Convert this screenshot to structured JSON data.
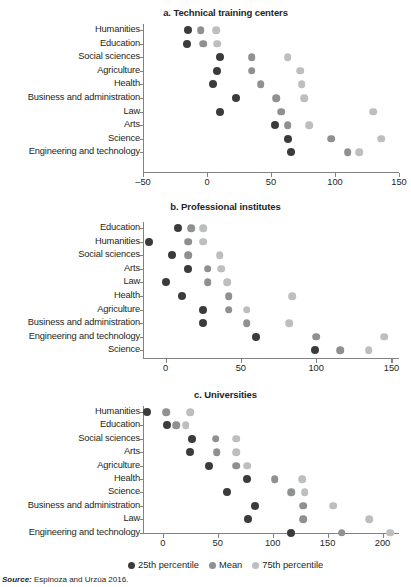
{
  "source": {
    "prefix": "Source:",
    "text": "Espinoza and Urzúa 2016."
  },
  "legend": {
    "items": [
      {
        "label": "25th percentile",
        "color": "#3b3b3d"
      },
      {
        "label": "Mean",
        "color": "#8e9092"
      },
      {
        "label": "75th percentile",
        "color": "#bcbec0"
      }
    ]
  },
  "chart_data": [
    {
      "type": "scatter",
      "title": "a. Technical training centers",
      "xlabel": "",
      "ylabel": "",
      "xlim": [
        -50,
        150
      ],
      "xticks": [
        -50,
        0,
        50,
        100,
        150
      ],
      "xticklabels": [
        "–50",
        "0",
        "50",
        "100",
        "150"
      ],
      "grid": false,
      "legend_position": "figure-bottom",
      "categories": [
        "Humanities",
        "Education",
        "Social sciences",
        "Agriculture",
        "Health",
        "Business and administration",
        "Law",
        "Arts",
        "Science",
        "Engineering and technology"
      ],
      "series": [
        {
          "name": "25th percentile",
          "color": "#3b3b3d",
          "values": [
            -15,
            -16,
            10,
            8,
            5,
            23,
            10,
            53,
            63,
            66
          ]
        },
        {
          "name": "Mean",
          "color": "#8e9092",
          "values": [
            -5,
            -3,
            35,
            35,
            42,
            54,
            58,
            63,
            97,
            110
          ]
        },
        {
          "name": "75th percentile",
          "color": "#bcbec0",
          "values": [
            7,
            8,
            63,
            73,
            74,
            76,
            130,
            80,
            136,
            119
          ]
        }
      ]
    },
    {
      "type": "scatter",
      "title": "b. Professional institutes",
      "xlabel": "",
      "ylabel": "",
      "xlim": [
        -15,
        155
      ],
      "xticks": [
        0,
        50,
        100,
        150
      ],
      "xticklabels": [
        "0",
        "50",
        "100",
        "150"
      ],
      "grid": false,
      "legend_position": "figure-bottom",
      "categories": [
        "Education",
        "Humanities",
        "Social sciences",
        "Arts",
        "Law",
        "Health",
        "Agriculture",
        "Business and administration",
        "Engineering and technology",
        "Science"
      ],
      "series": [
        {
          "name": "25th percentile",
          "color": "#3b3b3d",
          "values": [
            8,
            -11,
            4,
            15,
            0,
            11,
            25,
            25,
            60,
            99
          ]
        },
        {
          "name": "Mean",
          "color": "#8e9092",
          "values": [
            17,
            15,
            15,
            28,
            28,
            42,
            42,
            54,
            100,
            116
          ]
        },
        {
          "name": "75th percentile",
          "color": "#bcbec0",
          "values": [
            25,
            25,
            36,
            37,
            41,
            84,
            54,
            82,
            145,
            135
          ]
        }
      ]
    },
    {
      "type": "scatter",
      "title": "c. Universities",
      "xlabel": "",
      "ylabel": "",
      "xlim": [
        -18,
        215
      ],
      "xticks": [
        0,
        50,
        100,
        150,
        200
      ],
      "xticklabels": [
        "0",
        "50",
        "100",
        "150",
        "200"
      ],
      "grid": false,
      "legend_position": "figure-bottom",
      "categories": [
        "Humanities",
        "Education",
        "Social sciences",
        "Arts",
        "Agriculture",
        "Health",
        "Science",
        "Business and administration",
        "Law",
        "Engineering and technology"
      ],
      "series": [
        {
          "name": "25th percentile",
          "color": "#3b3b3d",
          "values": [
            -14,
            4,
            27,
            25,
            42,
            77,
            58,
            84,
            78,
            117
          ]
        },
        {
          "name": "Mean",
          "color": "#8e9092",
          "values": [
            3,
            12,
            48,
            49,
            67,
            102,
            117,
            128,
            128,
            163
          ]
        },
        {
          "name": "75th percentile",
          "color": "#bcbec0",
          "values": [
            25,
            21,
            67,
            67,
            77,
            127,
            129,
            155,
            188,
            207
          ]
        }
      ]
    }
  ]
}
